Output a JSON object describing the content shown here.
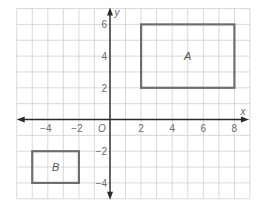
{
  "diagram": {
    "type": "coordinate-plane",
    "grid": {
      "x_min": -6,
      "x_max": 9,
      "y_min": -5,
      "y_max": 7,
      "step": 1,
      "line_color": "#cfcfcf"
    },
    "axes": {
      "x_label": "x",
      "y_label": "y",
      "origin_label": "O",
      "color": "#2a2a2a",
      "x_ticks": [
        {
          "value": -4,
          "label": "−4"
        },
        {
          "value": -2,
          "label": "−2"
        },
        {
          "value": 2,
          "label": "2"
        },
        {
          "value": 4,
          "label": "4"
        },
        {
          "value": 6,
          "label": "6"
        },
        {
          "value": 8,
          "label": "8"
        }
      ],
      "y_ticks": [
        {
          "value": 6,
          "label": "6"
        },
        {
          "value": 4,
          "label": "4"
        },
        {
          "value": 2,
          "label": "2"
        },
        {
          "value": -2,
          "label": "−2"
        },
        {
          "value": -4,
          "label": "−4"
        }
      ]
    },
    "shapes": [
      {
        "name": "A",
        "label": "A",
        "x1": 2,
        "y1": 2,
        "x2": 8,
        "y2": 6,
        "stroke": "#6e6e6e"
      },
      {
        "name": "B",
        "label": "B",
        "x1": -5,
        "y1": -4,
        "x2": -2,
        "y2": -2,
        "stroke": "#6e6e6e"
      }
    ]
  }
}
